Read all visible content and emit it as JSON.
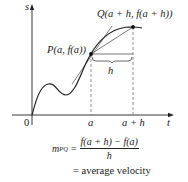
{
  "diagram": {
    "axes": {
      "y_label": "s",
      "x_label": "t",
      "origin_label": "0"
    },
    "points": {
      "P": {
        "label_prefix": "P",
        "label_args": "(a, f(a))"
      },
      "Q": {
        "label_prefix": "Q",
        "label_args": "(a + h, f(a + h))"
      }
    },
    "ticks": {
      "a": "a",
      "a_plus_h": "a + h"
    },
    "interval_label": "h",
    "formula": {
      "lhs": "m",
      "lhs_sub": "PQ",
      "eq": "=",
      "numerator": "f(a + h) − f(a)",
      "denominator": "h",
      "result": "= average velocity"
    },
    "colors": {
      "ink": "#222222",
      "tangent": "#555555",
      "guides": "#777777"
    }
  }
}
